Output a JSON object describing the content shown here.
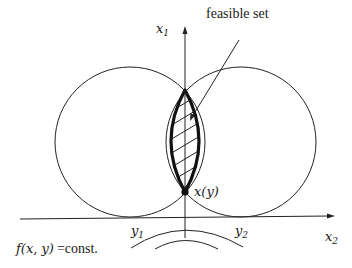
{
  "diagram": {
    "labels": {
      "x1_axis": {
        "base": "x",
        "sub": "1"
      },
      "x2_axis": {
        "base": "x",
        "sub": "2"
      },
      "y1": {
        "base": "y",
        "sub": "1"
      },
      "y2": {
        "base": "y",
        "sub": "2"
      },
      "feasible_set": "feasible set",
      "point": "x(y)",
      "level_set_prefix": "f(x, y)",
      "level_set_suffix": "=const."
    },
    "colors": {
      "stroke": "#222222",
      "background": "#ffffff"
    },
    "elements": {
      "circles": [
        {
          "name": "left-circle",
          "cx": 130,
          "cy": 142,
          "r": 75
        },
        {
          "name": "right-circle",
          "cx": 241,
          "cy": 142,
          "r": 75
        }
      ],
      "point": {
        "x": 185,
        "y": 192
      },
      "level_curves": 2
    }
  }
}
